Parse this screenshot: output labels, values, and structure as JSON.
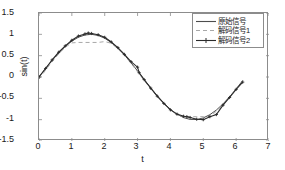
{
  "chart_data": {
    "type": "line",
    "title": "",
    "xlabel": "t",
    "ylabel": "sin(t)",
    "xlim": [
      0,
      7
    ],
    "ylim": [
      -1.5,
      1.5
    ],
    "xticks": [
      "0",
      "1",
      "2",
      "3",
      "4",
      "5",
      "6",
      "7"
    ],
    "yticks": [
      "1.5",
      "1",
      "0.5",
      "0",
      "-0.5",
      "-1",
      "-1.5"
    ],
    "grid": false,
    "legend_position": "top-right",
    "colors": {
      "original": "#4d4d4d",
      "decoded1": "#a8a8a8",
      "decoded2": "#2b2b2b",
      "axis": "#8c8c8c",
      "background": "#ffffff"
    },
    "series": [
      {
        "name": "原始信号",
        "style": "solid",
        "marker": "none",
        "color": "#4d4d4d",
        "x": [
          0,
          0.2,
          0.4,
          0.6,
          0.8,
          1.0,
          1.2,
          1.4,
          1.6,
          1.8,
          2.0,
          2.2,
          2.4,
          2.6,
          2.8,
          3.0,
          3.2,
          3.4,
          3.6,
          3.8,
          4.0,
          4.2,
          4.4,
          4.6,
          4.8,
          5.0,
          5.2,
          5.4,
          5.6,
          5.8,
          6.0,
          6.2
        ],
        "y": [
          0.0,
          0.199,
          0.389,
          0.565,
          0.717,
          0.841,
          0.932,
          0.985,
          1.0,
          0.974,
          0.909,
          0.808,
          0.675,
          0.516,
          0.335,
          0.141,
          -0.058,
          -0.256,
          -0.443,
          -0.612,
          -0.757,
          -0.872,
          -0.952,
          -0.994,
          -0.996,
          -0.959,
          -0.883,
          -0.773,
          -0.631,
          -0.465,
          -0.279,
          -0.083
        ]
      },
      {
        "name": "解码信号1",
        "style": "dashed",
        "marker": "none",
        "color": "#a8a8a8",
        "x": [
          0,
          0.2,
          0.4,
          0.6,
          0.8,
          1.0,
          1.2,
          1.4,
          1.6,
          1.8,
          2.0,
          2.2,
          2.4,
          2.6,
          2.8,
          3.0,
          3.2,
          3.4,
          3.6,
          3.8,
          4.0,
          4.2,
          4.4,
          4.6,
          4.8,
          5.0,
          5.2,
          5.4,
          5.6,
          5.8,
          6.0,
          6.2
        ],
        "y": [
          -0.05,
          0.16,
          0.36,
          0.54,
          0.7,
          0.8,
          0.81,
          0.81,
          0.81,
          0.81,
          0.83,
          0.79,
          0.66,
          0.5,
          0.32,
          0.12,
          -0.08,
          -0.28,
          -0.46,
          -0.63,
          -0.78,
          -0.88,
          -0.93,
          -0.93,
          -0.93,
          -0.93,
          -0.93,
          -0.8,
          -0.65,
          -0.48,
          -0.29,
          -0.1
        ]
      },
      {
        "name": "解码信号2",
        "style": "solid",
        "marker": "plus",
        "color": "#2b2b2b",
        "x": [
          0,
          0.2,
          0.4,
          0.6,
          0.8,
          1.0,
          1.2,
          1.4,
          1.5,
          1.6,
          1.8,
          2.0,
          2.2,
          2.4,
          2.6,
          2.8,
          3.0,
          3.05,
          3.2,
          3.4,
          3.6,
          3.8,
          4.0,
          4.2,
          4.4,
          4.5,
          4.6,
          4.8,
          5.0,
          5.2,
          5.4,
          5.6,
          5.8,
          6.0,
          6.2
        ],
        "y": [
          0.0,
          0.2,
          0.4,
          0.58,
          0.73,
          0.86,
          0.96,
          1.01,
          1.03,
          1.02,
          0.99,
          0.93,
          0.82,
          0.69,
          0.53,
          0.36,
          0.23,
          0.1,
          -0.06,
          -0.26,
          -0.45,
          -0.62,
          -0.77,
          -0.87,
          -0.92,
          -0.93,
          -0.95,
          -0.99,
          -1.0,
          -0.93,
          -0.88,
          -0.66,
          -0.48,
          -0.29,
          -0.12
        ]
      }
    ]
  },
  "legend": {
    "entries": [
      {
        "label": "原始信号"
      },
      {
        "label": "解码信号1"
      },
      {
        "label": "解码信号2"
      }
    ]
  },
  "axes": {
    "xlabel": "t",
    "ylabel": "sin(t)",
    "xticks": [
      "0",
      "1",
      "2",
      "3",
      "4",
      "5",
      "6",
      "7"
    ],
    "yticks": [
      "1.5",
      "1",
      "0.5",
      "0",
      "-0.5",
      "-1",
      "-1.5"
    ]
  }
}
